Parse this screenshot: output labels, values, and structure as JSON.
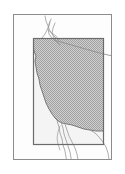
{
  "figure": {
    "type": "map-thumbnail",
    "width": 125,
    "height": 174,
    "background_color": "#ffffff"
  },
  "colors": {
    "page_background": "#ffffff",
    "outer_frame_stroke": "#8c8c8c",
    "outer_frame_fill": "#fdfdfd",
    "inner_box_stroke": "#6b6b6b",
    "inner_box_fill": "#f4f4f4",
    "study_area_fill": "#b9b9b9",
    "study_area_stroke": "#6e6e6e",
    "hydrography_stroke": "#9a9a9a",
    "boundary_stroke": "#8a8a8a"
  },
  "layers": [
    {
      "name": "outer-frame",
      "label": "Map neatline",
      "geometry": "rectangle",
      "x": 13,
      "y": 14,
      "width": 99,
      "height": 146,
      "stroke_width": 1
    },
    {
      "name": "inner-extent-box",
      "label": "Study area extent box",
      "geometry": "rectangle",
      "x": 33,
      "y": 38,
      "width": 71,
      "height": 107,
      "stroke_width": 1.2
    },
    {
      "name": "study-area-polygon",
      "label": "Shaded western states region",
      "geometry": "polygon",
      "fill_pattern": "dither-gray"
    },
    {
      "name": "coastline",
      "label": "Pacific coastline",
      "geometry": "polyline"
    },
    {
      "name": "river-network",
      "label": "River / drainage lines",
      "geometry": "polyline"
    },
    {
      "name": "state-boundary-diagonal",
      "label": "Diagonal state boundary line",
      "geometry": "polyline"
    }
  ],
  "paths": {
    "study_area": "M 33 38 L 33 48 L 35 52 L 36 58 L 35 64 L 37 70 L 38 76 L 40 82 L 42 88 L 43 94 L 45 100 L 47 106 L 50 112 L 53 117 L 56 120 L 58 123 L 62 125 L 68 126 L 74 127 L 80 129 L 86 131 L 92 132 L 98 133 L 104 133 L 104 38 Z",
    "coastline": "M 52 22 L 54 27 L 52 31 L 50 35 L 47 40 L 44 45 L 41 50 L 39 56 L 38 62 L 37 68 L 38 74 L 39 80 L 41 86 L 42 92 L 44 98 L 46 104 L 49 110 L 52 115 L 55 119 L 58 122",
    "river_main": "M 46 16 L 48 22 L 50 28 L 52 33 L 55 37 L 58 40 L 60 44 L 62 48",
    "river_branch_a": "M 52 20 L 50 26 L 49 32 L 50 37 L 53 41 L 56 44",
    "river_branch_b": "M 56 24 L 54 30 L 53 36 L 55 41 L 58 45",
    "boundary_diagonal": "M 55 40 L 70 45 L 85 50 L 100 55 L 112 58",
    "south_river_a": "M 58 122 L 60 128 L 62 134 L 64 140 L 66 146 L 68 152 L 70 158",
    "south_river_b": "M 62 124 L 64 130 L 66 136 L 68 142 L 70 148 L 72 154 L 74 160",
    "south_river_c": "M 66 126 L 68 132 L 70 138 L 73 144 L 76 150 L 79 156",
    "south_coast": "M 86 131 L 92 134 L 98 138 L 103 143 L 106 148 L 108 154 L 109 160"
  },
  "annotations": {
    "has_labels": false,
    "has_legend": false,
    "has_scale_bar": false,
    "has_north_arrow": false
  }
}
